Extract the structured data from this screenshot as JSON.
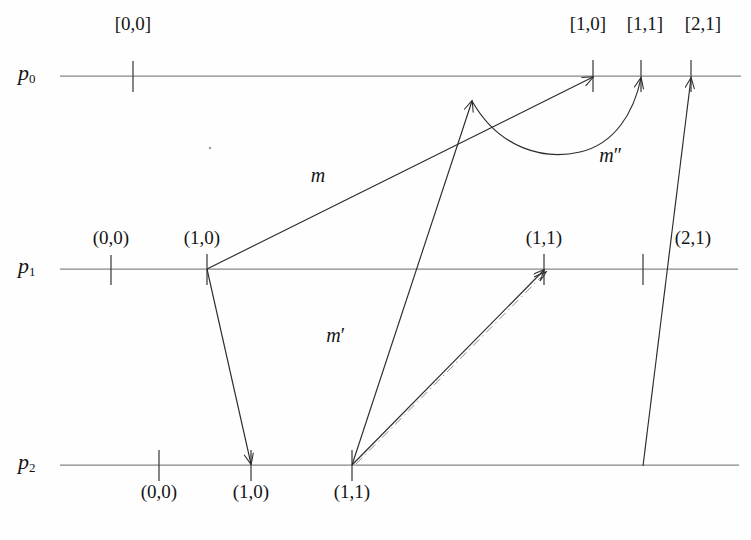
{
  "figure": {
    "background_color": "#fefefe",
    "line_color": "#7a7a7a",
    "arrow_color": "#2b2b2b",
    "text_color": "#141414"
  },
  "rails": [
    {
      "id": "p0",
      "name": "p",
      "index": "0",
      "y": 76
    },
    {
      "id": "p1",
      "name": "p",
      "index": "1",
      "y": 269
    },
    {
      "id": "p2",
      "name": "p",
      "index": "2",
      "y": 465
    }
  ],
  "rail_labels": [
    {
      "name": "p",
      "index": "0",
      "x": 18,
      "y": 62
    },
    {
      "name": "p",
      "index": "1",
      "x": 18,
      "y": 255
    },
    {
      "name": "p",
      "index": "2",
      "x": 18,
      "y": 451
    }
  ],
  "ticks": {
    "p0": [
      {
        "label": "[0,0]",
        "x": 133,
        "label_x": 133,
        "label_y": 14,
        "label_above": true
      },
      {
        "label": "[1,0]",
        "x": 593,
        "label_x": 588,
        "label_y": 14,
        "label_above": true
      },
      {
        "label": "[1,1]",
        "x": 641,
        "label_x": 645,
        "label_y": 14,
        "label_above": true
      },
      {
        "label": "[2,1]",
        "x": 691,
        "label_x": 703,
        "label_y": 14,
        "label_above": true
      }
    ],
    "p1": [
      {
        "label": "(0,0)",
        "x": 111,
        "label_x": 111,
        "label_y": 228,
        "label_above": true
      },
      {
        "label": "(1,0)",
        "x": 207,
        "label_x": 202,
        "label_y": 228,
        "label_above": true
      },
      {
        "label": "(1,1)",
        "x": 544,
        "label_x": 544,
        "label_y": 228,
        "label_above": true
      },
      {
        "label": "(2,1)",
        "x": 643,
        "label_x": 693,
        "label_y": 228,
        "label_above": true
      }
    ],
    "p2": [
      {
        "label": "(0,0)",
        "x": 159,
        "label_x": 159,
        "label_y": 482,
        "label_above": false
      },
      {
        "label": "(1,0)",
        "x": 251,
        "label_x": 251,
        "label_y": 482,
        "label_above": false
      },
      {
        "label": "(1,1)",
        "x": 352,
        "label_x": 352,
        "label_y": 482,
        "label_above": false
      }
    ]
  },
  "map_labels": [
    {
      "id": "m",
      "base": "m",
      "prime": "",
      "x": 318,
      "y": 165
    },
    {
      "id": "m-prime",
      "base": "m",
      "prime": "′",
      "x": 336,
      "y": 325
    },
    {
      "id": "m-dprime",
      "base": "m",
      "prime": "″",
      "x": 611,
      "y": 145
    }
  ],
  "arrows": [
    {
      "id": "m-arrow",
      "from": "p1 (1,0)",
      "to": "p0 [1,0]",
      "style": "solid-straight"
    },
    {
      "id": "down-arrow",
      "from": "p1 (1,0)",
      "to": "p2 (1,0)",
      "style": "solid-straight"
    },
    {
      "id": "up-arrow",
      "from": "p2 (1,1)",
      "to": "mid-point",
      "style": "solid-straight"
    },
    {
      "id": "m-dprime-curve",
      "from": "mid-point",
      "to": "p0 [1,1]",
      "style": "solid-curved"
    },
    {
      "id": "m-prime-arrow",
      "from": "p2 (1,1)",
      "to": "p1 (1,1)",
      "style": "solid-straight"
    },
    {
      "id": "dashdot-arrow",
      "from": "p2 (1,1)",
      "to": "p1 (1,1)",
      "style": "dash-dot"
    },
    {
      "id": "two-one-arrow",
      "from": "p1 (2,1)",
      "to": "p0 [2,1]",
      "style": "solid-straight"
    }
  ],
  "stray_dot": {
    "x": 210,
    "y": 148
  }
}
